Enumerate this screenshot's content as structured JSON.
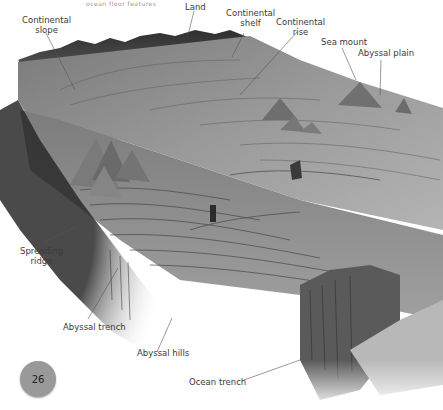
{
  "header": {
    "caption": "ocean floor features"
  },
  "figure": {
    "colors": {
      "background": "#ffffff",
      "terrain_dark": "#3c3c3c",
      "terrain_mid": "#8a8a8a",
      "terrain_light": "#c8c8c8",
      "label_text": "#3a3a3a",
      "leader_line": "#555555"
    },
    "labels": [
      {
        "id": "continental-slope",
        "text_line1": "Continental",
        "text_line2": "slope"
      },
      {
        "id": "land",
        "text_line1": "Land",
        "text_line2": ""
      },
      {
        "id": "continental-shelf",
        "text_line1": "Continental",
        "text_line2": "shelf"
      },
      {
        "id": "continental-rise",
        "text_line1": "Continental",
        "text_line2": "rise"
      },
      {
        "id": "sea-mount",
        "text_line1": "Sea mount",
        "text_line2": ""
      },
      {
        "id": "abyssal-plain",
        "text_line1": "Abyssal plain",
        "text_line2": ""
      },
      {
        "id": "spreading-ridge",
        "text_line1": "Spreading",
        "text_line2": "ridge"
      },
      {
        "id": "abyssal-trench",
        "text_line1": "Abyssal trench",
        "text_line2": ""
      },
      {
        "id": "abyssal-hills",
        "text_line1": "Abyssal hills",
        "text_line2": ""
      },
      {
        "id": "ocean-trench",
        "text_line1": "Ocean trench",
        "text_line2": ""
      }
    ]
  },
  "footer": {
    "page_number": "26",
    "page_badge_color": "#999999"
  }
}
